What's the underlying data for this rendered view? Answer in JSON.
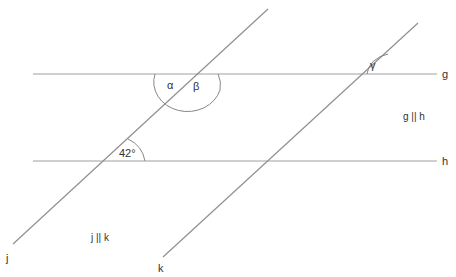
{
  "diagram": {
    "title": "",
    "lines": {
      "g": {
        "label": "g",
        "x1": 33,
        "y1": 74,
        "x2": 437,
        "y2": 74
      },
      "h": {
        "label": "h",
        "x1": 33,
        "y1": 161,
        "x2": 437,
        "y2": 161
      },
      "j": {
        "label": "j",
        "x1": 13,
        "y1": 244,
        "x2": 268,
        "y2": 9
      },
      "k": {
        "label": "k",
        "x1": 163,
        "y1": 257,
        "x2": 418,
        "y2": 23
      }
    },
    "angles": {
      "alpha": {
        "label": "α"
      },
      "beta": {
        "label": "β"
      },
      "gamma": {
        "label": "γ"
      },
      "given": {
        "label": "42°"
      }
    },
    "annotations": {
      "g_parallel_h": "g || h",
      "j_parallel_k": "j || k"
    },
    "colors": {
      "line": "#999999",
      "text": "#333333"
    }
  }
}
